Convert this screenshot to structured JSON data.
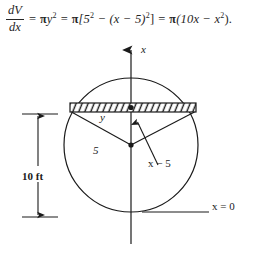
{
  "equation": {
    "derivative_numerator": "dV",
    "derivative_denominator": "dx",
    "equals_1": "=",
    "term_1_pi": "π",
    "term_1_var": "y",
    "term_1_exp": "2",
    "equals_2": "=",
    "term_2_pi": "π",
    "term_2_body": "[5",
    "term_2_exp_a": "2",
    "term_2_minus": "−",
    "term_2_paren": "(x − 5)",
    "term_2_exp_b": "2",
    "term_2_close": "]",
    "equals_3": "=",
    "term_3_pi": "π",
    "term_3_body": "(10x − x",
    "term_3_exp": "2",
    "term_3_close": ").",
    "full_text": "dV/dx = πy² = π[5² − (x − 5)²] = π(10x − x²)."
  },
  "figure": {
    "labels": {
      "x_axis": "x",
      "strip_width": "y",
      "radius": "5",
      "height_above_center": "x − 5",
      "baseline": "x = 0",
      "diameter_dimension": "10 ft"
    },
    "colors": {
      "stroke": "#1a1a1a",
      "background": "#ffffff",
      "hatch": "#1a1a1a"
    },
    "geometry": {
      "circle_center_x": 131,
      "circle_center_y": 109,
      "circle_radius": 67,
      "strip_top_y": 67,
      "strip_bottom_y": 76,
      "strip_left_x": 70,
      "strip_right_x": 196,
      "axis_top_y": 10,
      "axis_bottom_y": 208,
      "baseline_y": 176,
      "dimension_line_x": 38,
      "dimension_top_y": 78,
      "dimension_bottom_y": 181
    }
  }
}
